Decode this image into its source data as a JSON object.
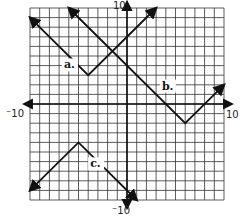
{
  "chart_data": {
    "type": "line",
    "title": "",
    "xlabel": "",
    "ylabel": "",
    "xlim": [
      -10,
      10
    ],
    "ylim": [
      -10,
      10
    ],
    "grid": true,
    "grid_step": 1,
    "axis_labels": {
      "x_min": "⁻10",
      "x_max": "10",
      "y_min": "⁻10",
      "y_max": "10"
    },
    "series": [
      {
        "name": "a.",
        "shape": "absolute-value",
        "vertex": [
          -4,
          3
        ],
        "opens": "up",
        "points": [
          [
            -10,
            9
          ],
          [
            -4,
            3
          ],
          [
            3,
            10
          ]
        ],
        "label_pos": [
          -6.5,
          3.7
        ]
      },
      {
        "name": "b.",
        "shape": "absolute-value",
        "vertex": [
          6,
          -2
        ],
        "opens": "up",
        "points": [
          [
            -6,
            10
          ],
          [
            6,
            -2
          ],
          [
            10,
            2
          ]
        ],
        "label_pos": [
          3.6,
          1.5
        ]
      },
      {
        "name": "c.",
        "shape": "absolute-value",
        "vertex": [
          -5,
          -4
        ],
        "opens": "down",
        "points": [
          [
            -10,
            -9
          ],
          [
            -5,
            -4
          ],
          [
            1,
            -10
          ]
        ],
        "label_pos": [
          -3.8,
          -6.6
        ]
      }
    ]
  },
  "colors": {
    "grid": "#333333",
    "axis": "#111111",
    "curve": "#111111",
    "background": "#ffffff"
  }
}
